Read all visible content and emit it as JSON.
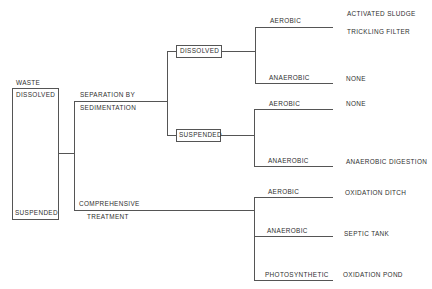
{
  "root": {
    "title": "WASTE",
    "top_label": "DISSOLVED",
    "bottom_label": "SUSPENDED"
  },
  "level1": {
    "separation": {
      "line1": "SEPARATION BY",
      "line2": "SEDIMENTATION"
    },
    "comprehensive": {
      "line1": "COMPREHENSIVE",
      "line2": "TREATMENT"
    }
  },
  "level2": {
    "dissolved": "DISSOLVED",
    "suspended": "SUSPENDED"
  },
  "process": {
    "dissolved_aerobic": "AEROBIC",
    "dissolved_anaerobic": "ANAEROBIC",
    "suspended_aerobic": "AEROBIC",
    "suspended_anaerobic": "ANAEROBIC",
    "comp_aerobic": "AEROBIC",
    "comp_anaerobic": "ANAEROBIC",
    "comp_photosynthetic": "PHOTOSYNTHETIC"
  },
  "outcomes": {
    "activated_sludge": "ACTIVATED SLUDGE",
    "trickling_filter": "TRICKLING FILTER",
    "dissolved_anaerobic": "NONE",
    "suspended_aerobic": "NONE",
    "anaerobic_digestion": "ANAEROBIC DIGESTION",
    "oxidation_ditch": "OXIDATION DITCH",
    "septic_tank": "SEPTIC TANK",
    "oxidation_pond": "OXIDATION POND"
  }
}
